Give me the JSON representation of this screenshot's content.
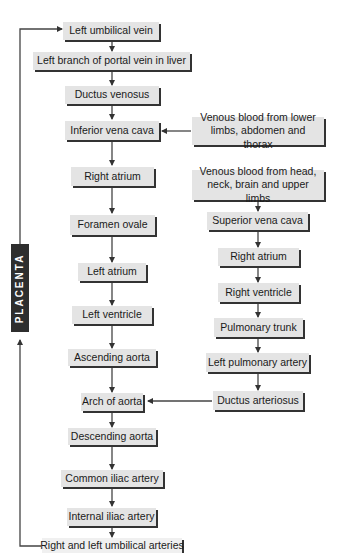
{
  "diagram": {
    "type": "flowchart",
    "side_label": "PLACENTA",
    "main_column": [
      "Left umbilical vein",
      "Left branch of portal vein in liver",
      "Ductus venosus",
      "Inferior vena cava",
      "Right atrium",
      "Foramen ovale",
      "Left atrium",
      "Left ventricle",
      "Ascending aorta",
      "Arch of aorta",
      "Descending aorta",
      "Common iliac artery",
      "Internal iliac artery",
      "Right and left umbilical arteries"
    ],
    "right_column": {
      "lower_source": "Venous blood from lower limbs, abdomen and thorax",
      "upper_source": "Venous blood from head, neck, brain and upper limbs",
      "chain": [
        "Superior vena cava",
        "Right atrium",
        "Right ventricle",
        "Pulmonary trunk",
        "Left pulmonary artery",
        "Ductus arteriosus"
      ]
    },
    "edges": [
      [
        "Left umbilical vein",
        "Left branch of portal vein in liver"
      ],
      [
        "Left branch of portal vein in liver",
        "Ductus venosus"
      ],
      [
        "Ductus venosus",
        "Inferior vena cava"
      ],
      [
        "Venous blood from lower limbs, abdomen and thorax",
        "Inferior vena cava"
      ],
      [
        "Inferior vena cava",
        "Right atrium"
      ],
      [
        "Right atrium",
        "Foramen ovale"
      ],
      [
        "Foramen ovale",
        "Left atrium"
      ],
      [
        "Left atrium",
        "Left ventricle"
      ],
      [
        "Left ventricle",
        "Ascending aorta"
      ],
      [
        "Ascending aorta",
        "Arch of aorta"
      ],
      [
        "Ductus arteriosus",
        "Arch of aorta"
      ],
      [
        "Arch of aorta",
        "Descending aorta"
      ],
      [
        "Descending aorta",
        "Common iliac artery"
      ],
      [
        "Common iliac artery",
        "Internal iliac artery"
      ],
      [
        "Internal iliac artery",
        "Right and left umbilical arteries"
      ],
      [
        "Right and left umbilical arteries",
        "PLACENTA"
      ],
      [
        "PLACENTA",
        "Left umbilical vein"
      ],
      [
        "Venous blood from head, neck, brain and upper limbs",
        "Superior vena cava"
      ],
      [
        "Superior vena cava",
        "Right atrium"
      ],
      [
        "Right atrium",
        "Right ventricle"
      ],
      [
        "Right ventricle",
        "Pulmonary trunk"
      ],
      [
        "Pulmonary trunk",
        "Left pulmonary artery"
      ],
      [
        "Left pulmonary artery",
        "Ductus arteriosus"
      ]
    ]
  }
}
